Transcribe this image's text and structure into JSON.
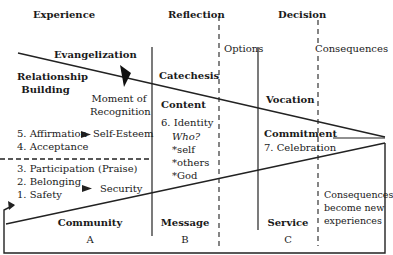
{
  "headers": {
    "experience": "Experience",
    "reflection": "Reflection",
    "decision": "Decision"
  },
  "sub_headers": {
    "options": "Options",
    "consequences": "Consequences"
  },
  "column_a": {
    "evangelization": "Evangelization",
    "relationship_building": [
      "Relationship",
      "Building"
    ],
    "moment_of_recognition": [
      "Moment of",
      "Recognition"
    ],
    "upper_steps": [
      {
        "num": "5.",
        "label": "Affirmation",
        "result": "Self-Esteem"
      },
      {
        "num": "4.",
        "label": "Acceptance"
      }
    ],
    "lower_steps": [
      {
        "num": "3.",
        "label": "Participation (Praise)"
      },
      {
        "num": "2.",
        "label": "Belonging"
      },
      {
        "num": "1.",
        "label": "Safety"
      }
    ],
    "security": "Security",
    "footer": "Community",
    "letter": "A"
  },
  "column_b": {
    "catechesis": "Catechesis",
    "content": "Content",
    "identity": "6. Identity",
    "who": "Who?",
    "who_items": [
      "*self",
      "*others",
      "*God"
    ],
    "footer": "Message",
    "letter": "B"
  },
  "column_c": {
    "vocation": "Vocation",
    "commitment": "Commitment",
    "celebration": "7. Celebration",
    "footer": "Service",
    "letter": "C"
  },
  "outcome": {
    "lines": [
      "Consequences",
      "become new",
      "experiences"
    ]
  }
}
